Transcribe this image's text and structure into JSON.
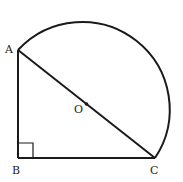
{
  "diagram": {
    "type": "geometry",
    "points": {
      "A": {
        "label": "A",
        "x": 18,
        "y": 50
      },
      "B": {
        "label": "B",
        "x": 18,
        "y": 158
      },
      "C": {
        "label": "C",
        "x": 155,
        "y": 158
      },
      "O": {
        "label": "O",
        "x": 86.5,
        "y": 104
      }
    },
    "segments": [
      "AB",
      "BC",
      "AC"
    ],
    "arc": {
      "from": "A",
      "to": "C",
      "center": "O",
      "radius": 87.5,
      "side": "outside triangle"
    },
    "right_angle_marker": {
      "at": "B",
      "size": 15
    },
    "colors": {
      "stroke": "#1a1a1a",
      "background": "#ffffff"
    }
  }
}
